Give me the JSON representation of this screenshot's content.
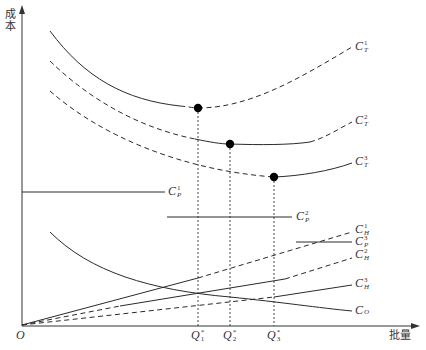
{
  "axes": {
    "y_label": "成本",
    "x_label": "批量",
    "origin": "O"
  },
  "x_ticks": [
    {
      "base": "Q",
      "sub": "1",
      "sup": "*"
    },
    {
      "base": "Q",
      "sub": "2",
      "sup": "*"
    },
    {
      "base": "Q",
      "sub": "3",
      "sup": "*"
    }
  ],
  "curve_labels": {
    "ct1": {
      "base": "C",
      "sup": "1",
      "sub": "T"
    },
    "ct2": {
      "base": "C",
      "sup": "2",
      "sub": "T"
    },
    "ct3": {
      "base": "C",
      "sup": "3",
      "sub": "T"
    },
    "cp1": {
      "base": "C",
      "sup": "1",
      "sub": "P"
    },
    "cp2": {
      "base": "C",
      "sup": "2",
      "sub": "P"
    },
    "cp3": {
      "base": "C",
      "sup": "3",
      "sub": "P"
    },
    "ch1": {
      "base": "C",
      "sup": "1",
      "sub": "H"
    },
    "ch2": {
      "base": "C",
      "sup": "2",
      "sub": "H"
    },
    "ch3": {
      "base": "C",
      "sup": "3",
      "sub": "H"
    },
    "co": {
      "base": "C",
      "sup": "",
      "sub": "O"
    }
  },
  "colors": {
    "line": "#2a2a2a",
    "dot": "#000000",
    "background": "#ffffff"
  }
}
